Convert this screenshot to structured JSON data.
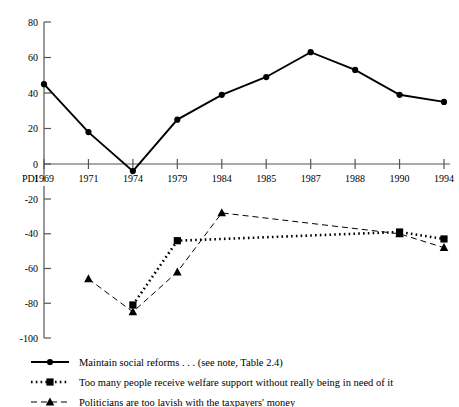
{
  "chart_data": {
    "type": "line",
    "title": "",
    "xlabel": "PDI",
    "ylabel": "",
    "grid": false,
    "legend_position": "bottom-left",
    "categories": [
      "1969",
      "1971",
      "1974",
      "1979",
      "1984",
      "1985",
      "1987",
      "1988",
      "1990",
      "1994"
    ],
    "panels": [
      {
        "name": "upper-panel",
        "ylim": [
          0,
          80
        ],
        "yticks": [
          0,
          20,
          40,
          60,
          80
        ],
        "ytick_labels": [
          "0",
          "20",
          "40",
          "60",
          "80"
        ]
      },
      {
        "name": "lower-panel",
        "ylim": [
          -100,
          -20
        ],
        "yticks": [
          -20,
          -40,
          -60,
          -80,
          -100
        ],
        "ytick_labels": [
          "-20",
          "-40",
          "-60",
          "-80",
          "-100"
        ]
      }
    ],
    "series": [
      {
        "name": "Maintain social reforms . . . (see note, Table 2.4)",
        "marker": "circle",
        "line": "solid",
        "panel": "upper-panel",
        "x": [
          "1969",
          "1971",
          "1974",
          "1979",
          "1984",
          "1985",
          "1987",
          "1988",
          "1990",
          "1994"
        ],
        "values": [
          45,
          18,
          -4,
          25,
          39,
          49,
          63,
          53,
          39,
          35
        ]
      },
      {
        "name": "Too many people receive welfare support without really being in need of it",
        "marker": "square",
        "line": "dotted",
        "panel": "lower-panel",
        "x": [
          "1974",
          "1979",
          "1990",
          "1994"
        ],
        "values": [
          -81,
          -44,
          -39,
          -43
        ]
      },
      {
        "name": "Politicians are too lavish with the taxpayers' money",
        "marker": "triangle",
        "line": "dashed",
        "panel": "lower-panel",
        "x": [
          "1971",
          "1974",
          "1979",
          "1984",
          "1990",
          "1994"
        ],
        "values": [
          -66,
          -85,
          -62,
          -28,
          -40,
          -48
        ]
      }
    ],
    "annotations": []
  },
  "axis": {
    "x_label": "PDI",
    "x_tick_labels": [
      "1969",
      "1971",
      "1974",
      "1979",
      "1984",
      "1985",
      "1987",
      "1988",
      "1990",
      "1994"
    ],
    "upper_y_tick_labels": [
      "80",
      "60",
      "40",
      "20",
      "0"
    ],
    "lower_y_tick_labels": [
      "-20",
      "-40",
      "-60",
      "-80",
      "-100"
    ]
  },
  "legend": {
    "items": [
      {
        "label": "Maintain social reforms . . . (see note, Table 2.4)",
        "marker": "circle",
        "line": "solid"
      },
      {
        "label": "Too many people receive welfare support without really being in need of it",
        "marker": "square",
        "line": "dotted"
      },
      {
        "label": "Politicians are too lavish with the taxpayers' money",
        "marker": "triangle",
        "line": "dashed"
      }
    ]
  },
  "colors": {
    "ink": "#000000",
    "background": "#ffffff",
    "axis": "#555555"
  }
}
